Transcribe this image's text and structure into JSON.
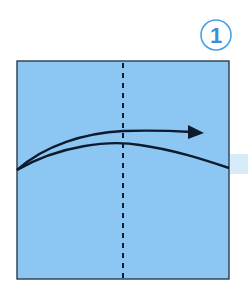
{
  "step": {
    "number": "1",
    "color": "#3a8fd6"
  },
  "paper": {
    "fill": "#8cc6f2",
    "border": "#2b3a4a",
    "band_color": "#d6ecf8"
  },
  "lines": {
    "fold_line": "valley-fold-dashed-vertical",
    "arrow": "fold-direction-arrow-right",
    "line_color": "#0e1b2c"
  }
}
